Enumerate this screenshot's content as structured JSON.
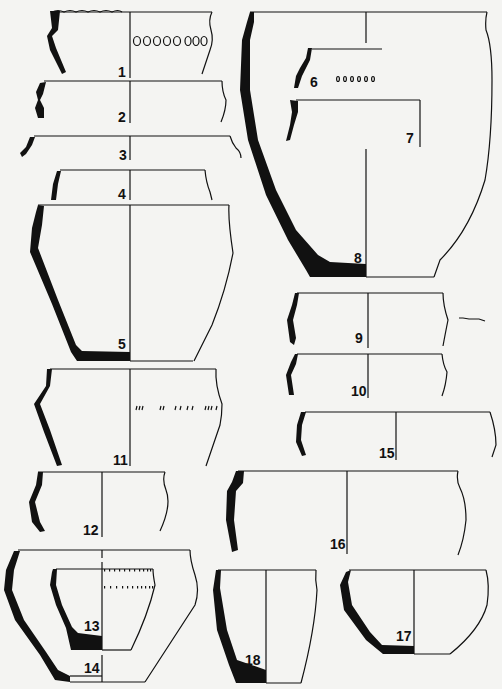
{
  "figure": {
    "type": "pottery-profile-plate",
    "vessels": [
      {
        "id": "1",
        "label": "1",
        "decoration": "incised oval/circle band below rim, cord-impressed rim"
      },
      {
        "id": "2",
        "label": "2"
      },
      {
        "id": "3",
        "label": "3"
      },
      {
        "id": "4",
        "label": "4"
      },
      {
        "id": "5",
        "label": "5"
      },
      {
        "id": "6",
        "label": "6",
        "decoration": "row of small oval impressions"
      },
      {
        "id": "7",
        "label": "7"
      },
      {
        "id": "8",
        "label": "8"
      },
      {
        "id": "9",
        "label": "9"
      },
      {
        "id": "10",
        "label": "10"
      },
      {
        "id": "11",
        "label": "11",
        "decoration": "row of short oblique incisions"
      },
      {
        "id": "12",
        "label": "12"
      },
      {
        "id": "13",
        "label": "13",
        "decoration": "two rows of small impressions below rim"
      },
      {
        "id": "14",
        "label": "14"
      },
      {
        "id": "15",
        "label": "15"
      },
      {
        "id": "16",
        "label": "16"
      },
      {
        "id": "17",
        "label": "17"
      },
      {
        "id": "18",
        "label": "18"
      }
    ],
    "colors": {
      "ink": "#111111",
      "paper": "#f4f4f2"
    }
  }
}
